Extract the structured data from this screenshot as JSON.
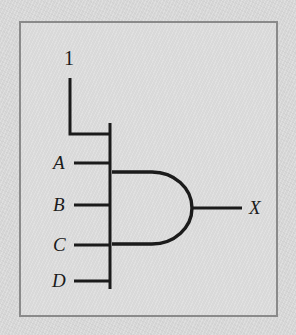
{
  "figure": {
    "kind": "logic-gate-schematic",
    "gate_type": "AND",
    "colors": {
      "background": "#d6d6d6",
      "panel": "#d9d9d9",
      "frame_border": "#8a8a8a",
      "wire": "#1b1b1b",
      "label_text": "#1b1b1b"
    }
  },
  "labels": {
    "constant": "1",
    "input_a": "A",
    "input_b": "B",
    "input_c": "C",
    "input_d": "D",
    "output": "X"
  },
  "nodes": {
    "constant_source": "1",
    "inputs": [
      "A",
      "B",
      "C",
      "D"
    ],
    "outputs": [
      "X"
    ]
  }
}
